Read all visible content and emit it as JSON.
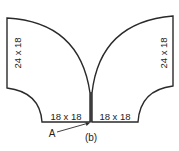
{
  "figure": {
    "caption": "(b)",
    "callout": {
      "label": "A"
    },
    "pieces": {
      "left_upper": {
        "dimension": "24 x 18"
      },
      "right_upper": {
        "dimension": "24 x 18"
      },
      "left_lower": {
        "dimension": "18 x 18"
      },
      "right_lower": {
        "dimension": "18 x 18"
      }
    },
    "colors": {
      "line": "#2a2a2a",
      "background": "#ffffff"
    }
  }
}
